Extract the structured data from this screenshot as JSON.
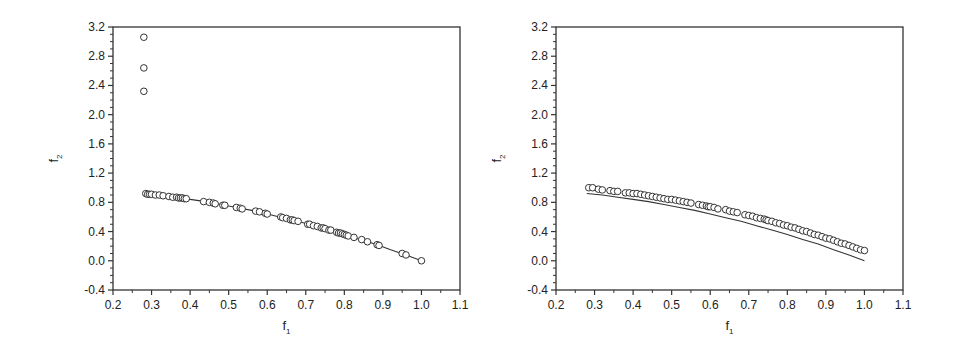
{
  "chart_data": [
    {
      "type": "scatter",
      "title": "",
      "xlabel": "f1",
      "ylabel": "f2",
      "xlim": [
        0.2,
        1.1
      ],
      "ylim": [
        -0.4,
        3.2
      ],
      "xticks": [
        "0.2",
        "0.3",
        "0.4",
        "0.5",
        "0.6",
        "0.7",
        "0.8",
        "0.9",
        "1.0",
        "1.1"
      ],
      "yticks": [
        "-0.4",
        "0.0",
        "0.4",
        "0.8",
        "1.2",
        "1.6",
        "2.0",
        "2.4",
        "2.8",
        "3.2"
      ],
      "grid": false,
      "legend": null,
      "series": [
        {
          "name": "reference front",
          "kind": "line",
          "x": [
            0.28,
            0.32,
            0.36,
            0.4,
            0.44,
            0.48,
            0.52,
            0.56,
            0.6,
            0.64,
            0.68,
            0.72,
            0.76,
            0.8,
            0.84,
            0.88,
            0.92,
            0.96,
            1.0
          ],
          "y": [
            0.92,
            0.9,
            0.87,
            0.84,
            0.81,
            0.77,
            0.73,
            0.69,
            0.64,
            0.59,
            0.54,
            0.48,
            0.42,
            0.36,
            0.29,
            0.23,
            0.15,
            0.08,
            0.0
          ]
        },
        {
          "name": "obtained solutions",
          "kind": "markers",
          "x": [
            0.28,
            0.28,
            0.28,
            0.285,
            0.29,
            0.295,
            0.3,
            0.31,
            0.32,
            0.33,
            0.345,
            0.355,
            0.365,
            0.37,
            0.375,
            0.38,
            0.385,
            0.39,
            0.435,
            0.45,
            0.46,
            0.465,
            0.485,
            0.49,
            0.52,
            0.53,
            0.535,
            0.57,
            0.58,
            0.595,
            0.6,
            0.635,
            0.64,
            0.65,
            0.66,
            0.665,
            0.67,
            0.68,
            0.705,
            0.71,
            0.72,
            0.73,
            0.74,
            0.745,
            0.75,
            0.76,
            0.765,
            0.78,
            0.785,
            0.79,
            0.795,
            0.8,
            0.805,
            0.81,
            0.825,
            0.845,
            0.86,
            0.885,
            0.89,
            0.95,
            0.96,
            1.0
          ],
          "y": [
            3.06,
            2.64,
            2.32,
            0.92,
            0.91,
            0.91,
            0.91,
            0.9,
            0.9,
            0.89,
            0.88,
            0.87,
            0.87,
            0.86,
            0.86,
            0.86,
            0.85,
            0.85,
            0.81,
            0.8,
            0.79,
            0.78,
            0.76,
            0.76,
            0.73,
            0.72,
            0.71,
            0.68,
            0.67,
            0.65,
            0.64,
            0.6,
            0.59,
            0.58,
            0.56,
            0.56,
            0.55,
            0.54,
            0.5,
            0.5,
            0.48,
            0.47,
            0.45,
            0.45,
            0.44,
            0.42,
            0.42,
            0.39,
            0.38,
            0.38,
            0.37,
            0.36,
            0.35,
            0.34,
            0.32,
            0.29,
            0.26,
            0.22,
            0.21,
            0.1,
            0.08,
            0.0
          ]
        }
      ]
    },
    {
      "type": "scatter",
      "title": "",
      "xlabel": "f1",
      "ylabel": "f2",
      "xlim": [
        0.2,
        1.1
      ],
      "ylim": [
        -0.4,
        3.2
      ],
      "xticks": [
        "0.2",
        "0.3",
        "0.4",
        "0.5",
        "0.6",
        "0.7",
        "0.8",
        "0.9",
        "1.0",
        "1.1"
      ],
      "yticks": [
        "-0.4",
        "0.0",
        "0.4",
        "0.8",
        "1.2",
        "1.6",
        "2.0",
        "2.4",
        "2.8",
        "3.2"
      ],
      "grid": false,
      "legend": null,
      "series": [
        {
          "name": "reference front",
          "kind": "line",
          "x": [
            0.28,
            0.32,
            0.36,
            0.4,
            0.44,
            0.48,
            0.52,
            0.56,
            0.6,
            0.64,
            0.68,
            0.72,
            0.76,
            0.8,
            0.84,
            0.88,
            0.92,
            0.96,
            1.0
          ],
          "y": [
            0.92,
            0.9,
            0.87,
            0.84,
            0.81,
            0.77,
            0.73,
            0.69,
            0.64,
            0.59,
            0.54,
            0.48,
            0.42,
            0.36,
            0.29,
            0.23,
            0.15,
            0.08,
            0.0
          ]
        },
        {
          "name": "obtained solutions",
          "kind": "markers",
          "x": [
            0.285,
            0.295,
            0.31,
            0.32,
            0.34,
            0.35,
            0.36,
            0.38,
            0.39,
            0.4,
            0.41,
            0.42,
            0.43,
            0.44,
            0.45,
            0.46,
            0.47,
            0.48,
            0.49,
            0.5,
            0.51,
            0.52,
            0.53,
            0.54,
            0.55,
            0.57,
            0.58,
            0.59,
            0.595,
            0.6,
            0.61,
            0.62,
            0.64,
            0.65,
            0.66,
            0.67,
            0.69,
            0.7,
            0.71,
            0.72,
            0.73,
            0.74,
            0.745,
            0.75,
            0.76,
            0.77,
            0.78,
            0.79,
            0.8,
            0.81,
            0.82,
            0.83,
            0.84,
            0.85,
            0.86,
            0.87,
            0.88,
            0.89,
            0.9,
            0.91,
            0.92,
            0.93,
            0.94,
            0.95,
            0.96,
            0.97,
            0.98,
            0.99,
            1.0
          ],
          "y": [
            1.0,
            1.0,
            0.98,
            0.97,
            0.96,
            0.95,
            0.95,
            0.93,
            0.93,
            0.92,
            0.92,
            0.91,
            0.9,
            0.89,
            0.88,
            0.87,
            0.86,
            0.85,
            0.84,
            0.84,
            0.83,
            0.82,
            0.81,
            0.8,
            0.79,
            0.77,
            0.76,
            0.75,
            0.74,
            0.74,
            0.73,
            0.71,
            0.7,
            0.68,
            0.67,
            0.66,
            0.63,
            0.62,
            0.61,
            0.59,
            0.58,
            0.57,
            0.56,
            0.55,
            0.54,
            0.52,
            0.51,
            0.49,
            0.48,
            0.46,
            0.45,
            0.43,
            0.41,
            0.4,
            0.38,
            0.36,
            0.35,
            0.33,
            0.31,
            0.3,
            0.28,
            0.26,
            0.24,
            0.23,
            0.21,
            0.19,
            0.17,
            0.15,
            0.14
          ]
        }
      ]
    }
  ]
}
